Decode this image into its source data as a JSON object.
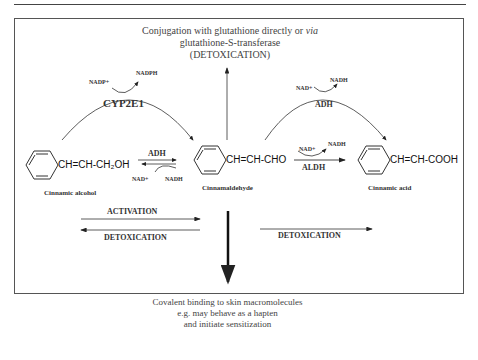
{
  "top_note": {
    "line1_prefix": "Conjugation with glutathione directly or ",
    "line1_italic": "via",
    "line2": "glutathione-S-transferase",
    "line3": "(DETOXICATION)"
  },
  "enzymes": {
    "cyp": "CYP2E1",
    "adh_top": "ADH",
    "adh_mid": "ADH",
    "aldh": "ALDH"
  },
  "cofactors": {
    "cyp_in": "NADP+",
    "cyp_out": "NADPH",
    "adh_top_in": "NAD+",
    "adh_top_out": "NADH",
    "adh_mid_in": "NAD+",
    "adh_mid_out": "NADH",
    "aldh_in": "NAD+",
    "aldh_out": "NADH"
  },
  "compounds": [
    {
      "formula": "CH=CH-CH₂OH",
      "name": "Cinnamic alcohol"
    },
    {
      "formula": "CH=CH-CHO",
      "name": "Cinnamaldehyde"
    },
    {
      "formula": "CH=CH-COOH",
      "name": "Cinnamic acid"
    }
  ],
  "process_labels": {
    "activation": "ACTIVATION",
    "detox_left": "DETOXICATION",
    "detox_right": "DETOXICATION"
  },
  "bottom_note": {
    "line1": "Covalent binding to skin macromolecules",
    "line2": "e.g. may behave as a hapten",
    "line3": "and initiate sensitization"
  }
}
